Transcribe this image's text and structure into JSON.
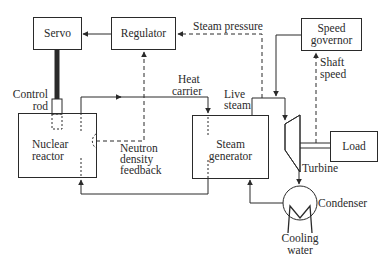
{
  "diagram": {
    "colors": {
      "line": "#2a2a2a",
      "background": "#ffffff"
    },
    "blocks": {
      "servo": {
        "label": "Servo"
      },
      "regulator": {
        "label": "Regulator"
      },
      "speed_governor": {
        "line1": "Speed",
        "line2": "governor"
      },
      "nuclear_reactor": {
        "line1": "Nuclear",
        "line2": "reactor"
      },
      "steam_generator": {
        "line1": "Steam",
        "line2": "generator"
      },
      "load": {
        "label": "Load"
      },
      "turbine": {
        "label": "Turbine"
      },
      "condenser": {
        "label": "Condenser"
      }
    },
    "labels": {
      "control_rod": {
        "line1": "Control",
        "line2": "rod"
      },
      "heat_carrier": {
        "line1": "Heat",
        "line2": "carrier"
      },
      "live_steam": {
        "line1": "Live",
        "line2": "steam"
      },
      "steam_pressure": {
        "label": "Steam  pressure"
      },
      "shaft_speed": {
        "line1": "Shaft",
        "line2": "speed"
      },
      "neutron_density_feedback": {
        "line1": "Neutron",
        "line2": "density",
        "line3": "feedback"
      },
      "cooling_water": {
        "line1": "Cooling",
        "line2": "water"
      }
    },
    "connections": [
      {
        "from": "Regulator",
        "to": "Servo",
        "style": "solid"
      },
      {
        "from": "Servo",
        "to": "Control rod",
        "style": "thick-solid"
      },
      {
        "from": "Nuclear reactor",
        "to": "Steam generator",
        "label": "Heat carrier",
        "style": "solid"
      },
      {
        "from": "Nuclear reactor",
        "to": "Regulator",
        "label": "Neutron density feedback",
        "style": "dashed"
      },
      {
        "from": "Live steam line",
        "to": "Regulator",
        "label": "Steam pressure",
        "style": "dashed"
      },
      {
        "from": "Speed governor",
        "to": "Live steam valve",
        "style": "solid"
      },
      {
        "from": "Steam generator",
        "to": "Turbine",
        "label": "Live steam",
        "style": "solid"
      },
      {
        "from": "Turbine shaft",
        "to": "Speed governor",
        "label": "Shaft speed",
        "style": "dashed"
      },
      {
        "from": "Turbine",
        "to": "Load",
        "style": "double-shaft"
      },
      {
        "from": "Turbine",
        "to": "Condenser",
        "style": "solid"
      },
      {
        "from": "Condenser",
        "to": "Steam generator",
        "style": "solid"
      },
      {
        "from": "Steam generator",
        "to": "Nuclear reactor",
        "style": "solid"
      }
    ]
  }
}
